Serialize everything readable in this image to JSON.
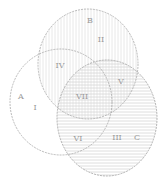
{
  "diagram": {
    "type": "venn",
    "sets": [
      {
        "id": "A",
        "label": "A",
        "cx": 61,
        "cy": 102,
        "rx": 51,
        "ry": 53
      },
      {
        "id": "B",
        "label": "B",
        "cx": 88,
        "cy": 64,
        "rx": 50,
        "ry": 55
      },
      {
        "id": "C",
        "label": "C",
        "cx": 107,
        "cy": 118,
        "rx": 50,
        "ry": 58
      }
    ],
    "set_labels": {
      "A": "A",
      "B": "B",
      "C": "C"
    },
    "regions": {
      "I": "I",
      "II": "II",
      "III": "III",
      "IV": "IV",
      "V": "V",
      "VI": "VI",
      "VII": "VII"
    },
    "colors": {
      "outline": "#a8a8a8",
      "label": "#9a9a9a",
      "hatch": "#dcdcdc"
    }
  }
}
